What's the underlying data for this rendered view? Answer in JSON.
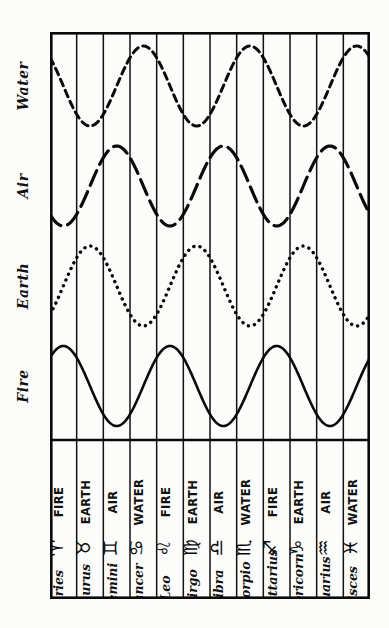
{
  "figure": {
    "kind": "hand-drawn astrological element-cycle chart",
    "orientation": "rotated 90 degrees (sideways page)",
    "background_color": "#fcfcfa",
    "ink_color": "#0a0a0a"
  },
  "column_headers": [
    {
      "label": "Fire",
      "id": "fire"
    },
    {
      "label": "Earth",
      "id": "earth"
    },
    {
      "label": "Air",
      "id": "air"
    },
    {
      "label": "Water",
      "id": "water"
    }
  ],
  "rows": [
    {
      "sign": "Aries",
      "glyph": "♈",
      "glyph_name": "aries-glyph",
      "element": "FIRE"
    },
    {
      "sign": "Taurus",
      "glyph": "♉",
      "glyph_name": "taurus-glyph",
      "element": "EARTH"
    },
    {
      "sign": "Gemini",
      "glyph": "♊",
      "glyph_name": "gemini-glyph",
      "element": "AIR"
    },
    {
      "sign": "Cancer",
      "glyph": "♋",
      "glyph_name": "cancer-glyph",
      "element": "WATER"
    },
    {
      "sign": "Leo",
      "glyph": "♌",
      "glyph_name": "leo-glyph",
      "element": "FIRE"
    },
    {
      "sign": "Virgo",
      "glyph": "♍",
      "glyph_name": "virgo-glyph",
      "element": "EARTH"
    },
    {
      "sign": "Libra",
      "glyph": "♎",
      "glyph_name": "libra-glyph",
      "element": "AIR"
    },
    {
      "sign": "Scorpio",
      "glyph": "♏",
      "glyph_name": "scorpio-glyph",
      "element": "WATER"
    },
    {
      "sign": "Sagittarius",
      "glyph": "♐",
      "glyph_name": "sagittarius-glyph",
      "element": "FIRE"
    },
    {
      "sign": "Capricorn",
      "glyph": "♑",
      "glyph_name": "capricorn-glyph",
      "element": "EARTH"
    },
    {
      "sign": "Aquarius",
      "glyph": "♒",
      "glyph_name": "aquarius-glyph",
      "element": "AIR"
    },
    {
      "sign": "Pisces",
      "glyph": "♓",
      "glyph_name": "pisces-glyph",
      "element": "WATER"
    }
  ],
  "chart_data": {
    "type": "line",
    "title": "",
    "xlabel": "",
    "ylabel": "",
    "grid": true,
    "legend_position": "top (handwritten labels outside frame)",
    "categories": [
      "Aries",
      "Taurus",
      "Gemini",
      "Cancer",
      "Leo",
      "Virgo",
      "Libra",
      "Scorpio",
      "Sagittarius",
      "Capricorn",
      "Aquarius",
      "Pisces"
    ],
    "x_note": "12 zodiac signs, one grid cell each",
    "ylim": [
      -1,
      1
    ],
    "y_note": "each elemental wave is a sine of period 4 signs, amplitude 1, peaking on its own triplicity",
    "series": [
      {
        "name": "Fire",
        "line_style": "solid",
        "peaks_at": [
          "Aries",
          "Leo",
          "Sagittarius"
        ],
        "troughs_at": [
          "Libra",
          "Aquarius",
          "Gemini"
        ],
        "values": [
          1.0,
          0.0,
          -1.0,
          0.0,
          1.0,
          0.0,
          -1.0,
          0.0,
          1.0,
          0.0,
          -1.0,
          0.0
        ]
      },
      {
        "name": "Earth",
        "line_style": "dotted",
        "peaks_at": [
          "Taurus",
          "Virgo",
          "Capricorn"
        ],
        "troughs_at": [
          "Scorpio",
          "Pisces",
          "Cancer"
        ],
        "values": [
          0.0,
          1.0,
          0.0,
          -1.0,
          0.0,
          1.0,
          0.0,
          -1.0,
          0.0,
          1.0,
          0.0,
          -1.0
        ]
      },
      {
        "name": "Air",
        "line_style": "long-dashed",
        "peaks_at": [
          "Gemini",
          "Libra",
          "Aquarius"
        ],
        "troughs_at": [
          "Sagittarius",
          "Aries",
          "Leo"
        ],
        "values": [
          -1.0,
          0.0,
          1.0,
          0.0,
          -1.0,
          0.0,
          1.0,
          0.0,
          -1.0,
          0.0,
          1.0,
          0.0
        ]
      },
      {
        "name": "Water",
        "line_style": "short-dashed",
        "peaks_at": [
          "Cancer",
          "Scorpio",
          "Pisces"
        ],
        "troughs_at": [
          "Capricorn",
          "Taurus",
          "Virgo"
        ],
        "values": [
          0.0,
          -1.0,
          0.0,
          1.0,
          0.0,
          -1.0,
          0.0,
          1.0,
          0.0,
          -1.0,
          0.0,
          1.0
        ]
      }
    ]
  }
}
